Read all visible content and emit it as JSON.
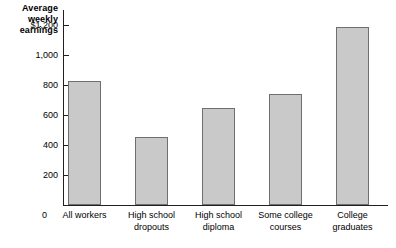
{
  "chart_data": {
    "type": "bar",
    "title": "",
    "ylabel": "Average weekly earnings",
    "xlabel": "",
    "categories": [
      "All workers",
      "High school dropouts",
      "High school diploma",
      "Some college courses",
      "College graduates"
    ],
    "category_lines": [
      [
        "All workers"
      ],
      [
        "High school",
        "dropouts"
      ],
      [
        "High school",
        "diploma"
      ],
      [
        "Some college",
        "courses"
      ],
      [
        "College",
        "graduates"
      ]
    ],
    "values": [
      825,
      455,
      650,
      740,
      1185
    ],
    "ylim": [
      0,
      1300
    ],
    "yticks": [
      0,
      200,
      400,
      600,
      800,
      1000,
      1200
    ],
    "ytick_labels": [
      "0",
      "200",
      "400",
      "600",
      "800",
      "1,000",
      "$1,200"
    ],
    "grid": false,
    "legend": null,
    "bar_fill_color": "#c9c9c9",
    "bar_border_color": "#6f6f6f",
    "axis_color": "#231f20"
  },
  "axis_title": {
    "lines": [
      "Average",
      "weekly",
      "earnings"
    ]
  }
}
